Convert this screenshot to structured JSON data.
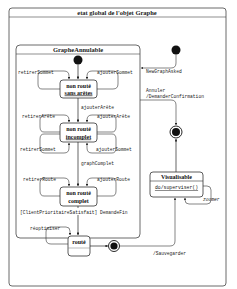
{
  "diagram": {
    "title": "etat global de l'objet Graphe",
    "composite": {
      "title": "GrapheAnnulable"
    },
    "states": {
      "s1_line1": "non routé",
      "s1_line2": "sans arêtes",
      "s2_line1": "non routé",
      "s2_line2": "incomplet",
      "s3_line1": "non routé",
      "s3_line2": "complet",
      "s4": "routé",
      "vis_title": "Visualisable",
      "vis_activity": "do/superviser()"
    },
    "transitions": {
      "retirerSommet_1": "retirerSommet",
      "ajouterSommet_1": "ajouterSommet",
      "ajouterArete_1": "ajouterArête",
      "retirerArete": "retirerArête",
      "ajouterArete_2": "ajouterArête",
      "retirerSommet_2": "retirerSommet",
      "ajouterSommet_2": "ajouterSommet",
      "graphComplet": "graphComplet",
      "retirerRoute": "retirerRoute",
      "ajouterRoute": "ajouterRoute",
      "guard_fin": "[ClientPrioritaireSatisfait] DemandeFin",
      "reoptimiser": "réoptimiser",
      "newGraph": "NewGraphAsked",
      "annuler_1": "Annuler",
      "annuler_2": "/DemanderConfirmation",
      "zoomer": "zoomer",
      "sauvegarder": "/Sauvegarder"
    }
  }
}
